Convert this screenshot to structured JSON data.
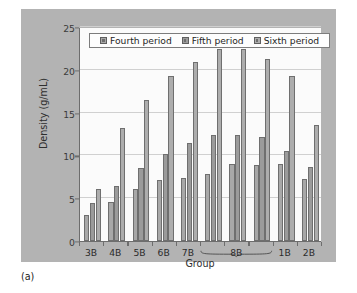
{
  "figure": {
    "caption": "(a)",
    "panel_color": "#b3b3b3",
    "plot_background": "#fbfbfb"
  },
  "chart_data": {
    "type": "bar",
    "title": "",
    "xlabel": "Group",
    "ylabel": "Density (g/mL)",
    "ylim": [
      0,
      25
    ],
    "yticks": [
      0,
      5,
      10,
      15,
      20,
      25
    ],
    "ytick_labels": [
      "0",
      "5",
      "10",
      "15",
      "20",
      "25"
    ],
    "grid": true,
    "grid_axis": "y",
    "legend_position": "top-center",
    "categories": [
      "3B",
      "4B",
      "5B",
      "6B",
      "7B",
      "8B",
      "8B",
      "8B",
      "1B",
      "2B"
    ],
    "tick_labels": [
      "3B",
      "4B",
      "5B",
      "6B",
      "7B",
      "8B",
      "1B",
      "2B"
    ],
    "bracket": {
      "label": "8B",
      "spans_groups": [
        5,
        6,
        7
      ],
      "note": "curly bracket spanning three bar triplets labeled 8B"
    },
    "series": [
      {
        "name": "Fourth period",
        "color": "#a8a8a8",
        "values": [
          3.0,
          4.6,
          6.1,
          7.1,
          7.4,
          7.8,
          9.0,
          8.9,
          9.0,
          7.2
        ]
      },
      {
        "name": "Fifth period",
        "color": "#9b9b9b",
        "values": [
          4.4,
          6.4,
          8.5,
          10.2,
          11.5,
          12.4,
          12.4,
          12.1,
          10.5,
          8.7
        ]
      },
      {
        "name": "Sixth period",
        "color": "#adadad",
        "values": [
          6.1,
          13.2,
          16.5,
          19.3,
          20.9,
          22.4,
          22.4,
          21.3,
          19.3,
          13.6
        ]
      }
    ]
  }
}
